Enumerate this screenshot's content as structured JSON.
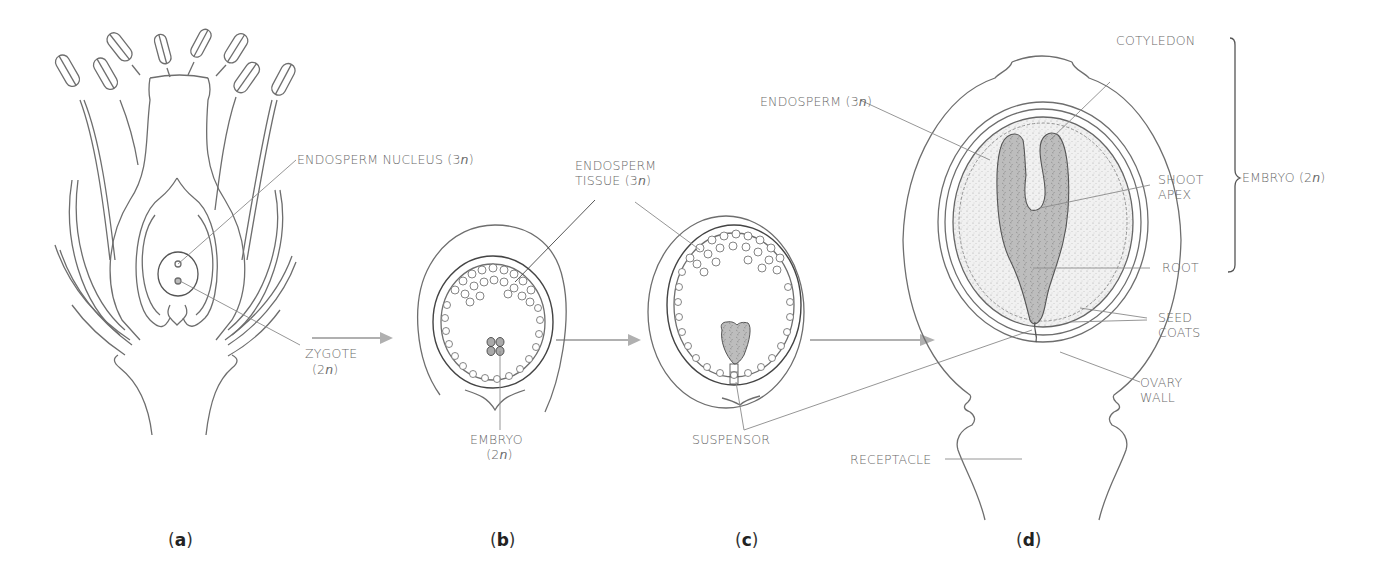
{
  "figure": {
    "panels": [
      {
        "id": "a",
        "label": "a"
      },
      {
        "id": "b",
        "label": "b"
      },
      {
        "id": "c",
        "label": "c"
      },
      {
        "id": "d",
        "label": "d"
      }
    ],
    "labels": {
      "endosperm_nucleus": "ENDOSPERM NUCLEUS",
      "endosperm_nucleus_ploidy": "3",
      "zygote": "ZYGOTE",
      "zygote_ploidy": "2",
      "endosperm_tissue_line1": "ENDOSPERM",
      "endosperm_tissue_line2": "TISSUE",
      "endosperm_tissue_ploidy": "3",
      "embryo_b": "EMBRYO",
      "embryo_b_ploidy": "2",
      "suspensor": "SUSPENSOR",
      "endosperm_d": "ENDOSPERM",
      "endosperm_d_ploidy": "3",
      "cotyledon": "COTYLEDON",
      "shoot_apex_line1": "SHOOT",
      "shoot_apex_line2": "APEX",
      "root": "ROOT",
      "embryo_d": "EMBRYO",
      "embryo_d_ploidy": "2",
      "seed_coats_line1": "SEED",
      "seed_coats_line2": "COATS",
      "ovary_wall_line1": "OVARY",
      "ovary_wall_line2": "WALL",
      "receptacle": "RECEPTACLE",
      "n": "n"
    },
    "colors": {
      "outline": "#6e6e6e",
      "leader": "#8a8a8a",
      "arrow": "#b0b0b0",
      "embryo_fill": "#bdbdbd",
      "endosperm_fill": "#ececec"
    }
  }
}
